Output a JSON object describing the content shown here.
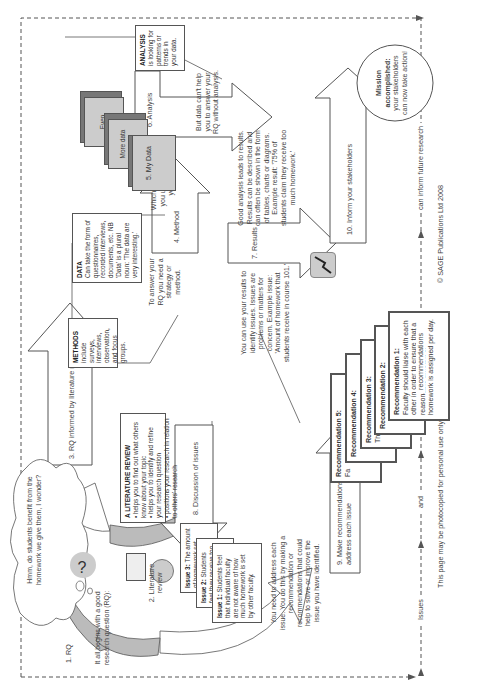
{
  "diagram": {
    "intro": "It all begins with a good research question (RQ):",
    "thought_bubble": "Hmm, do students benefit from the homework we give them, I wonder?",
    "steps": [
      {
        "label": "1. RQ"
      },
      {
        "label": "2. Literature review"
      },
      {
        "label": "3. RQ informed by literature review"
      },
      {
        "label": "4. Method"
      },
      {
        "label": "5. My Data"
      },
      {
        "label": "6. Analysis"
      },
      {
        "label": "7. Results"
      },
      {
        "label": "8. Discussion of issues"
      },
      {
        "label": "9. Make recommendations to address each issue"
      },
      {
        "label": "10. Inform your stakeholders"
      }
    ],
    "data_stack": [
      "Even",
      "More data",
      "5. My Data"
    ],
    "lit_review": {
      "title": "A LITERATURE REVIEW",
      "bullets": [
        "helps you to find out what others know about your topic",
        "helps you to identify and refine your research question",
        "positions your research in relation to others' research"
      ]
    },
    "methods_box": {
      "title": "METHODS",
      "text": "include surveys, interviews, observation, and focus groups."
    },
    "data_box": {
      "title": "DATA",
      "text": "Can take the form of questionnaires, recorded interviews, documents, etc. NB 'Data' is a plural noun: 'The data are very interesting.'"
    },
    "analysis_box": {
      "title": "ANALYSIS",
      "text": "is looking for patterns or trends in your data."
    },
    "notes": {
      "method": "To answer your RQ you need a strategy or method.",
      "whichever": "Whichever method you use will give you data.",
      "analysis": "But data can't help you to answer your RQ without analysis.",
      "results": "Good analysis leads to results. Results can be described and can often be shown in the form of tables, charts or diagrams. Example result: '75% of students claim they receive too much homework.'",
      "issues": "You can use your results to identify issues. Issues are problems or matters for concern. Example issue: 'Amount of homework that students receive in course 101.'",
      "recommend": "You need to address each issue. You do this by making a recommendation or recommendations that could help to solve or improve the issue you have identified."
    },
    "issues": [
      {
        "title": "Issue 3:",
        "text": "The amount of homework set does"
      },
      {
        "title": "Issue 2:",
        "text": "Students feel they receive too much homework"
      },
      {
        "title": "Issue 1:",
        "text": "Students feel that individual faculty are not aware of how much homework is set by other faculty."
      }
    ],
    "recommendations": [
      {
        "title": "Recommendation 5:",
        "text": "Fa"
      },
      {
        "title": "Recommendation 4:",
        "text": ""
      },
      {
        "title": "Recommendation 3:",
        "text": "Th ho"
      },
      {
        "title": "Recommendation 2:",
        "text": ""
      },
      {
        "title": "Recommendation 1:",
        "text": "Faculty should liaise with each other in order to ensure that a reasonable amount of homework is assigned per day."
      }
    ],
    "mission": {
      "title": "Mission accomplished:",
      "text": "your stakeholders can now take action!"
    },
    "footer_flow": [
      "Issues",
      "and",
      "recommendations",
      "can inform future research"
    ],
    "footer_note": "This page may be photocopied for personal use only",
    "copyright": "© SAGE Publications Ltd 2008"
  }
}
